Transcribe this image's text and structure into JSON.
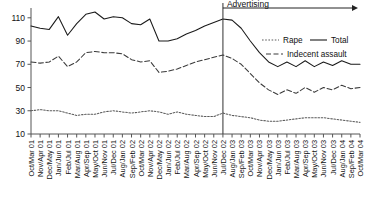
{
  "chart_data": {
    "type": "line",
    "title": "",
    "xlabel": "",
    "ylabel": "",
    "ylim": [
      10,
      115
    ],
    "yticks": [
      10,
      30,
      50,
      70,
      90,
      110
    ],
    "grid": false,
    "legend_position": "right-top",
    "categories": [
      "Oct/Mar 01",
      "Nov/Apr 01",
      "Dec/May 01",
      "Jan/Jun 01",
      "Feb/Jul 01",
      "Mar/Aug 01",
      "Apr/Sep 01",
      "May/Oct 01",
      "Jun/Nov 01",
      "Jul/Dec 01",
      "Aug/Jan 02",
      "Sep/Feb 02",
      "Oct/Mar 02",
      "Nov/Apr 02",
      "Dec/May 02",
      "Jan/Jun 02",
      "Feb/Jul 02",
      "Mar/Aug 02",
      "Apr/Sep 02",
      "May/Oct 02",
      "Jun/Nov 02",
      "Jul/Dec 02",
      "Aug/Jan 03",
      "Sep/Feb 03",
      "Oct/Mar 03",
      "Nov/Apr 03",
      "Dec/May 03",
      "Jan/Jun 03",
      "Feb/Jul 03",
      "Mar/Aug 03",
      "Apr/Sep 03",
      "May/Oct 03",
      "Jun/Nov 03",
      "Jul/Dec 03",
      "Aug/Jan 04",
      "Sep/Feb 04",
      "Oct/Mar 04"
    ],
    "series": [
      {
        "name": "Total",
        "style": "solid",
        "color": "#1a1a1a",
        "values": [
          103,
          101,
          100,
          111,
          95,
          105,
          113,
          115,
          109,
          111,
          110,
          105,
          104,
          109,
          90,
          90,
          92,
          96,
          99,
          103,
          106,
          109,
          108,
          101,
          90,
          80,
          72,
          68,
          72,
          68,
          73,
          68,
          72,
          69,
          73,
          70,
          70
        ]
      },
      {
        "name": "Indecent assault",
        "style": "dashed",
        "color": "#3a3a3a",
        "values": [
          72,
          71,
          72,
          77,
          68,
          72,
          80,
          81,
          80,
          80,
          79,
          74,
          72,
          73,
          63,
          64,
          66,
          69,
          72,
          74,
          76,
          78,
          75,
          70,
          62,
          54,
          48,
          44,
          48,
          45,
          50,
          46,
          50,
          48,
          52,
          49,
          50
        ]
      },
      {
        "name": "Rape",
        "style": "dotted",
        "color": "#5a5a5a",
        "values": [
          30,
          31,
          30,
          30,
          28,
          26,
          27,
          27,
          29,
          30,
          29,
          28,
          29,
          30,
          29,
          27,
          29,
          27,
          26,
          25,
          25,
          28,
          26,
          25,
          24,
          22,
          21,
          21,
          22,
          23,
          24,
          24,
          24,
          23,
          22,
          21,
          20
        ]
      }
    ],
    "annotations": [
      {
        "name": "advertising-marker",
        "label": "Advertising",
        "at_category": "Jul/Dec 02",
        "type": "vline-with-arrow"
      }
    ]
  },
  "legend": {
    "entries": [
      {
        "label": "Rape",
        "style": "dotted"
      },
      {
        "label": "Total",
        "style": "solid"
      },
      {
        "label": "Indecent assault",
        "style": "dashed"
      }
    ]
  }
}
